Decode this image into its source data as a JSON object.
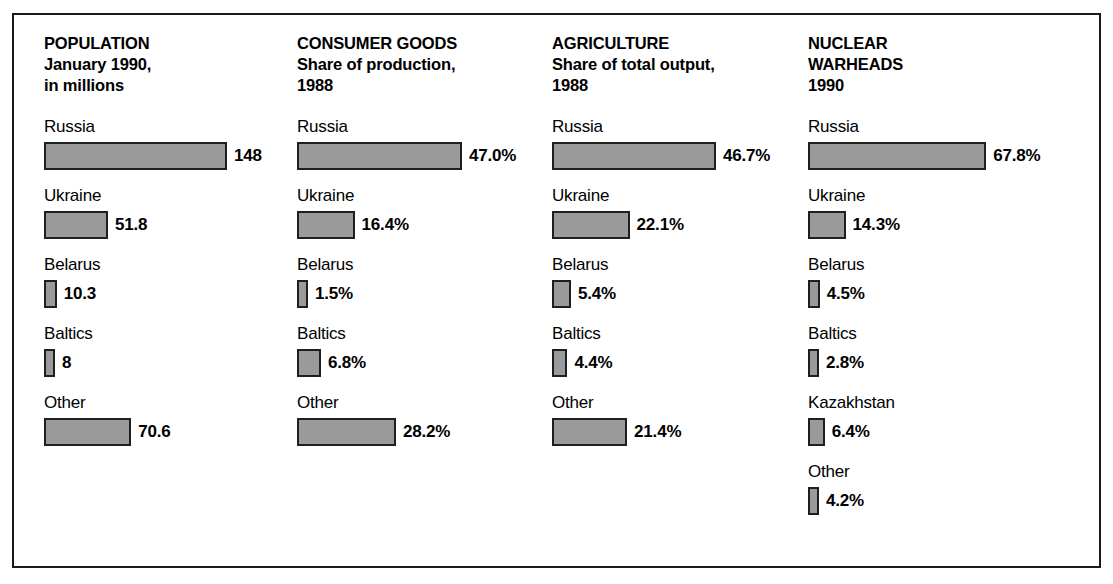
{
  "chart_data": {
    "type": "bar",
    "orientation": "horizontal",
    "grid": false,
    "legend": "none",
    "panels": [
      {
        "id": "population",
        "header": "POPULATION\nJanuary 1990,\nin millions",
        "header_title": "POPULATION",
        "header_sub1": "January 1990,",
        "header_sub2": "in millions",
        "unit": "millions",
        "px_per_unit": 1.236,
        "categories": [
          "Russia",
          "Ukraine",
          "Belarus",
          "Baltics",
          "Other"
        ],
        "values": [
          148,
          51.8,
          10.3,
          8,
          70.6
        ],
        "value_labels": [
          "148",
          "51.8",
          "10.3",
          "8",
          "70.6"
        ]
      },
      {
        "id": "consumer-goods",
        "header": "CONSUMER GOODS\nShare of production,\n1988",
        "header_title": "CONSUMER GOODS",
        "header_sub1": "Share of production,",
        "header_sub2": "1988",
        "unit": "percent",
        "px_per_unit": 3.51,
        "categories": [
          "Russia",
          "Ukraine",
          "Belarus",
          "Baltics",
          "Other"
        ],
        "values": [
          47.0,
          16.4,
          1.5,
          6.8,
          28.2
        ],
        "value_labels": [
          "47.0%",
          "16.4%",
          "1.5%",
          "6.8%",
          "28.2%"
        ]
      },
      {
        "id": "agriculture",
        "header": "AGRICULTURE\nShare of total output,\n1988",
        "header_title": "AGRICULTURE",
        "header_sub1": "Share of total output,",
        "header_sub2": "1988",
        "unit": "percent",
        "px_per_unit": 3.51,
        "categories": [
          "Russia",
          "Ukraine",
          "Belarus",
          "Baltics",
          "Other"
        ],
        "values": [
          46.7,
          22.1,
          5.4,
          4.4,
          21.4
        ],
        "value_labels": [
          "46.7%",
          "22.1%",
          "5.4%",
          "4.4%",
          "21.4%"
        ]
      },
      {
        "id": "nuclear-warheads",
        "header": "NUCLEAR\nWARHEADS\n1990",
        "header_title": "NUCLEAR",
        "header_sub1": "WARHEADS",
        "header_sub2": "1990",
        "unit": "percent",
        "px_per_unit": 2.63,
        "categories": [
          "Russia",
          "Ukraine",
          "Belarus",
          "Baltics",
          "Kazakhstan",
          "Other"
        ],
        "values": [
          67.8,
          14.3,
          4.5,
          2.8,
          6.4,
          4.2
        ],
        "value_labels": [
          "67.8%",
          "14.3%",
          "4.5%",
          "2.8%",
          "6.4%",
          "4.2%"
        ]
      }
    ]
  },
  "style": {
    "bar_fill": "#9a9a9a",
    "bar_stroke": "#1f1f1f",
    "frame_stroke": "#1a1a1a",
    "background": "#ffffff",
    "text_color": "#000000",
    "min_bar_width_px": 11
  }
}
